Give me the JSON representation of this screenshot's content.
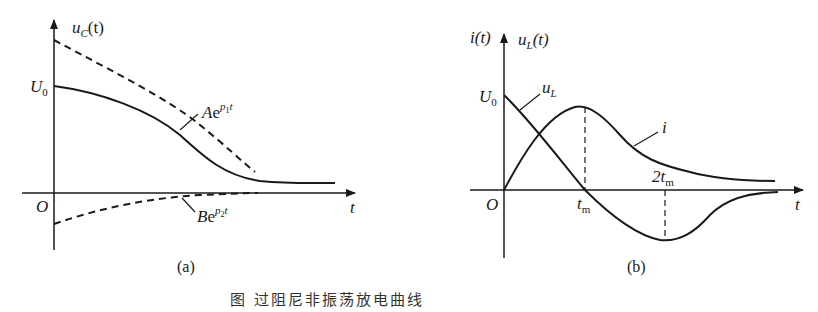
{
  "figure": {
    "caption": "图 过阻尼非振荡放电曲线",
    "ink_color": "#1a1a1a"
  },
  "panel_a": {
    "label": "(a)",
    "y_axis_label": "u",
    "y_axis_sub": "C",
    "y_axis_suffix": "(t)",
    "x_axis_label": "t",
    "origin_label": "O",
    "u0_label": "U",
    "u0_sub": "0",
    "curves": [
      {
        "name": "u_C(t)",
        "style": "solid"
      },
      {
        "name": "A e^{p1 t}",
        "style": "dashed",
        "label": "Ae",
        "exp": "p",
        "exp_sub": "1",
        "exp_t": "t"
      },
      {
        "name": "B e^{p2 t}",
        "style": "dashed",
        "label": "Be",
        "exp": "p",
        "exp_sub": "2",
        "exp_t": "t"
      }
    ]
  },
  "panel_b": {
    "label": "(b)",
    "y_axis_label_left": "i(t)",
    "y_axis_label_right": "u",
    "y_axis_right_sub": "L",
    "y_axis_right_suffix": "(t)",
    "x_axis_label": "t",
    "origin_label": "O",
    "u0_label": "U",
    "u0_sub": "0",
    "tm_label": "t",
    "tm_sub": "m",
    "two_tm_label": "2t",
    "two_tm_sub": "m",
    "curves": [
      {
        "name": "u_L",
        "style": "solid",
        "label": "u",
        "sub": "L"
      },
      {
        "name": "i",
        "style": "solid",
        "label": "i"
      }
    ]
  }
}
